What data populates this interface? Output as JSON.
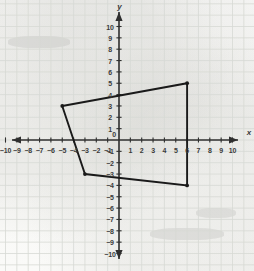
{
  "chart_data": {
    "type": "scatter",
    "title": "",
    "xlabel": "x",
    "ylabel": "y",
    "xlim": [
      -10.8,
      10.8
    ],
    "ylim": [
      -10.8,
      10.8
    ],
    "grid": true,
    "grid_step": 1,
    "axis_step": 1,
    "legend": "none",
    "x_ticks": [
      -10,
      -9,
      -8,
      -7,
      -6,
      -5,
      -4,
      -3,
      -2,
      -1,
      1,
      2,
      3,
      4,
      5,
      6,
      7,
      8,
      9,
      10
    ],
    "y_ticks": [
      10,
      9,
      8,
      7,
      6,
      5,
      4,
      3,
      2,
      1,
      -1,
      -2,
      -3,
      -4,
      -5,
      -6,
      -7,
      -8,
      -9,
      -10
    ],
    "origin_label": "0",
    "series": [
      {
        "name": "quadrilateral",
        "type": "polygon",
        "closed": true,
        "color": "#1a1a1a",
        "points": [
          {
            "x": -5,
            "y": 3
          },
          {
            "x": 6,
            "y": 5
          },
          {
            "x": 6,
            "y": -4
          },
          {
            "x": -3,
            "y": -3
          }
        ]
      }
    ]
  },
  "plot": {
    "x_axis_name": "x",
    "y_axis_name": "y",
    "origin_label": "0",
    "x_tick_labels": [
      "-10",
      "-9",
      "-8",
      "-7",
      "-6",
      "-5",
      "-4",
      "-3",
      "-2",
      "-1",
      "1",
      "2",
      "3",
      "4",
      "5",
      "6",
      "7",
      "8",
      "9",
      "10"
    ],
    "y_tick_labels": [
      "10",
      "9",
      "8",
      "7",
      "6",
      "5",
      "4",
      "3",
      "2",
      "1",
      "-1",
      "-2",
      "-3",
      "-4",
      "-5",
      "-6",
      "-7",
      "-8",
      "-9",
      "-10"
    ]
  },
  "colors": {
    "grid": "#d7d9d4",
    "axis": "#2f2f2f",
    "shape": "#1a1a1a",
    "label": "#3a3a3a",
    "paper": "#fbfbfa"
  }
}
